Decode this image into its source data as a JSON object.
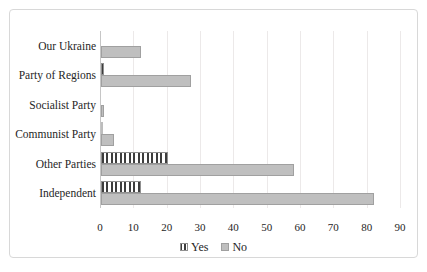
{
  "chart_data": {
    "type": "bar",
    "orientation": "horizontal",
    "title": "",
    "xlabel": "",
    "ylabel": "",
    "categories": [
      "Our Ukraine",
      "Party of Regions",
      "Socialist Party",
      "Communist Party",
      "Other Parties",
      "Independent"
    ],
    "series": [
      {
        "name": "Yes",
        "style": "striped",
        "values": [
          0,
          1,
          0,
          0.5,
          20,
          12
        ]
      },
      {
        "name": "No",
        "style": "solid",
        "values": [
          12,
          27,
          1,
          4,
          58,
          82
        ]
      }
    ],
    "xlim": [
      0,
      90
    ],
    "xticks": [
      0,
      10,
      20,
      30,
      40,
      50,
      60,
      70,
      80,
      90
    ],
    "grid": "vertical",
    "legend_position": "bottom"
  },
  "colors": {
    "no_fill": "#bfbfbf",
    "no_border": "#a0a0a0",
    "yes_stripe": "#3d3d3d",
    "yes_background": "#ffffff",
    "gridline": "#ece9e9",
    "axis_line": "#c6c6c6",
    "frame_border": "#d8d8d8",
    "text": "#262626"
  }
}
